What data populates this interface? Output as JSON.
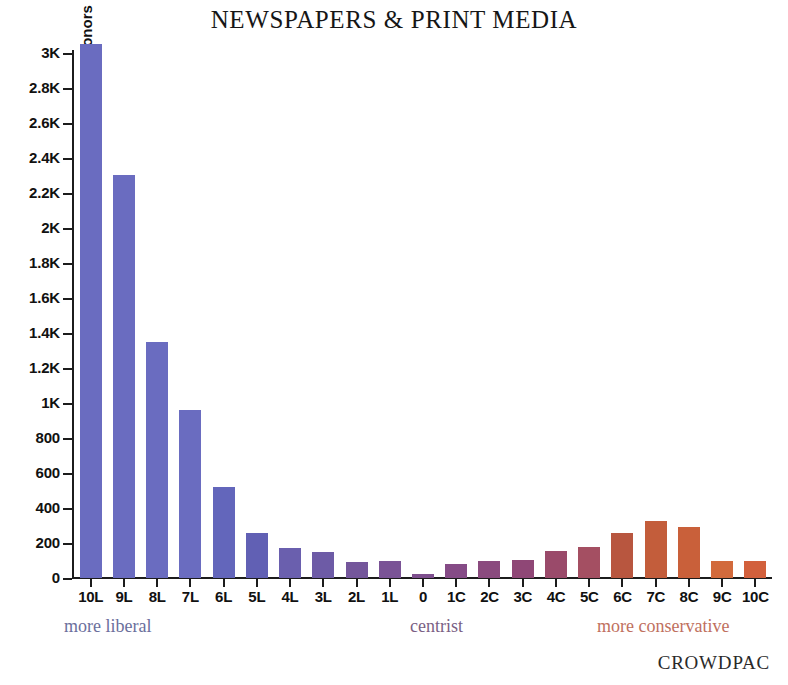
{
  "chart_data": {
    "type": "bar",
    "title": "NEWSPAPERS & PRINT MEDIA",
    "xlabel": "",
    "ylabel": "donors",
    "categories": [
      "10L",
      "9L",
      "8L",
      "7L",
      "6L",
      "5L",
      "4L",
      "3L",
      "2L",
      "1L",
      "0",
      "1C",
      "2C",
      "3C",
      "4C",
      "5C",
      "6C",
      "7C",
      "8C",
      "9C",
      "10C"
    ],
    "values": [
      3050,
      2305,
      1350,
      960,
      520,
      260,
      170,
      150,
      90,
      100,
      25,
      80,
      95,
      105,
      155,
      175,
      260,
      325,
      290,
      95,
      100
    ],
    "bar_colors": [
      "#6a6cc0",
      "#6a6cc0",
      "#6a6cc0",
      "#6a6cc0",
      "#6366bb",
      "#6160b4",
      "#6a5fae",
      "#6d5ba6",
      "#74569b",
      "#7a5396",
      "#7e4f8e",
      "#854b86",
      "#8a4a7e",
      "#8f4776",
      "#9a4a6a",
      "#a44f62",
      "#b8563f",
      "#c35d3b",
      "#c9603a",
      "#d26a3c",
      "#d2603c"
    ],
    "ylim": [
      0,
      3150
    ],
    "y_ticks": [
      {
        "label": "0",
        "value": 0
      },
      {
        "label": "200",
        "value": 200
      },
      {
        "label": "400",
        "value": 400
      },
      {
        "label": "600",
        "value": 600
      },
      {
        "label": "800",
        "value": 800
      },
      {
        "label": "1K",
        "value": 1000
      },
      {
        "label": "1.2K",
        "value": 1200
      },
      {
        "label": "1.4K",
        "value": 1400
      },
      {
        "label": "1.6K",
        "value": 1600
      },
      {
        "label": "1.8K",
        "value": 1800
      },
      {
        "label": "2K",
        "value": 2000
      },
      {
        "label": "2.2K",
        "value": 2200
      },
      {
        "label": "2.4K",
        "value": 2400
      },
      {
        "label": "2.6K",
        "value": 2600
      },
      {
        "label": "2.8K",
        "value": 2800
      },
      {
        "label": "3K",
        "value": 3000
      }
    ],
    "grid": false,
    "legend": "none",
    "annotations": {
      "more_liberal": "more liberal",
      "centrist": "centrist",
      "more_conservative": "more conservative"
    }
  },
  "footer": {
    "attribution": "CROWDPAC"
  },
  "colors": {
    "liberal_label": "#6b6f9c",
    "centrist_label": "#7a5f84",
    "conservative_label": "#c0705e",
    "axis": "#1c1c1c",
    "background": "#ffffff"
  }
}
